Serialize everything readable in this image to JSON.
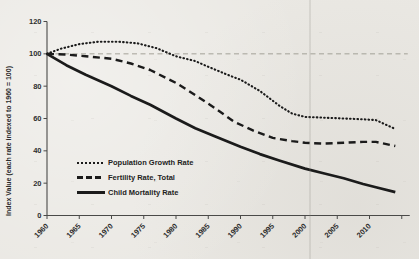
{
  "chart_data": {
    "type": "line",
    "title": "",
    "xlabel": "",
    "ylabel": "Index Value (each rate indexed to 1960 = 100)",
    "ylim": [
      0,
      120
    ],
    "xlim": [
      1960,
      2015
    ],
    "y_ticks": [
      0,
      20,
      40,
      60,
      80,
      100,
      120
    ],
    "x_ticks": [
      1960,
      1965,
      1970,
      1975,
      1980,
      1985,
      1990,
      1995,
      2000,
      2005,
      2010
    ],
    "x_minor_ticks": [
      2015
    ],
    "grid": false,
    "reference_line": {
      "y": 100,
      "style": "dashed"
    },
    "legend_position": "inside-lower-left",
    "series": [
      {
        "name": "Population Growth Rate",
        "style": "dotted",
        "x": [
          1960,
          1962,
          1965,
          1968,
          1971,
          1974,
          1977,
          1980,
          1983,
          1985,
          1988,
          1990,
          1993,
          1996,
          1998,
          2000,
          2003,
          2006,
          2009,
          2011,
          2014
        ],
        "values": [
          100,
          103,
          106,
          107.5,
          107.5,
          106.5,
          103.5,
          98.5,
          95.5,
          92,
          87,
          84,
          77,
          68,
          63,
          61,
          60.5,
          60,
          59.5,
          59,
          53.5
        ]
      },
      {
        "name": "Fertility Rate, Total",
        "style": "dashed",
        "x": [
          1960,
          1963,
          1966,
          1970,
          1973,
          1976,
          1980,
          1983,
          1986,
          1989,
          1992,
          1995,
          1998,
          2000,
          2003,
          2006,
          2009,
          2011,
          2014
        ],
        "values": [
          100,
          99.5,
          98.5,
          97,
          94,
          90,
          82,
          74.5,
          66.5,
          58,
          52.5,
          48,
          46,
          45,
          44.5,
          45,
          45.5,
          45.5,
          43
        ]
      },
      {
        "name": "Child Mortality Rate",
        "style": "solid",
        "x": [
          1960,
          1963,
          1966,
          1970,
          1973,
          1976,
          1980,
          1983,
          1986,
          1990,
          1993,
          1996,
          2000,
          2003,
          2006,
          2009,
          2011,
          2014
        ],
        "values": [
          100,
          93,
          87,
          80,
          74,
          68.5,
          60,
          54,
          49,
          42.5,
          38,
          34,
          29,
          26,
          23,
          19.5,
          17.5,
          14.5
        ]
      }
    ],
    "colors": {
      "line": "#1b1b1b",
      "axis": "#4a4a48",
      "tick_text": "#2e2e2e",
      "reference": "#9b988f",
      "paper": "#eae8e3"
    }
  }
}
